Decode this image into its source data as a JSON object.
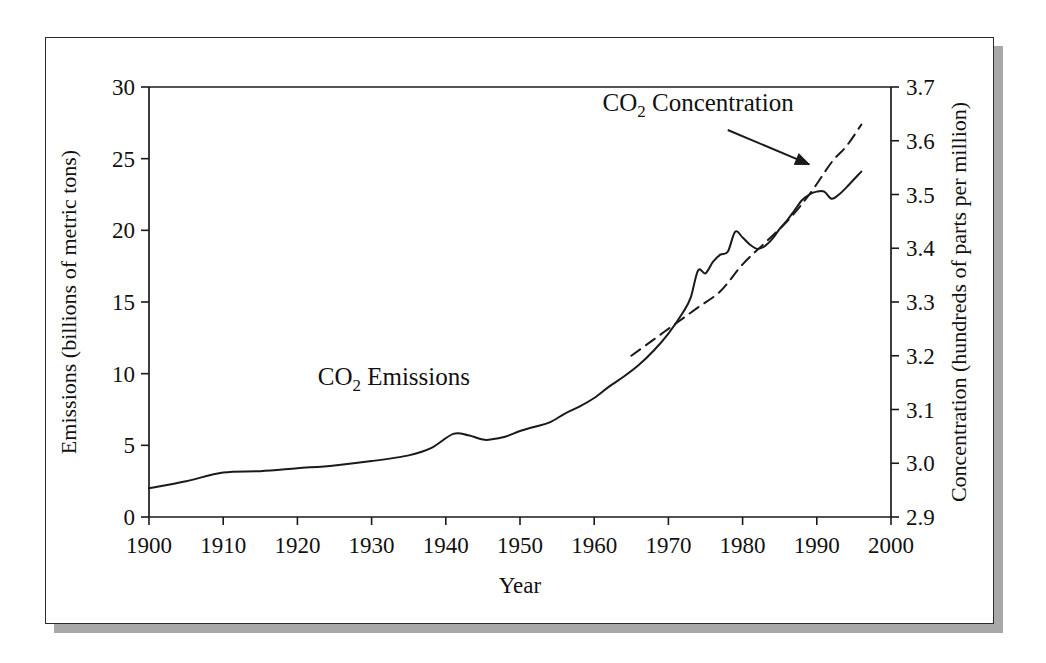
{
  "figure": {
    "background_color": "#ffffff",
    "frame_color": "#2b2b2b",
    "shadow_color": "#a8a8a8",
    "ink_color": "#1a1a1a"
  },
  "chart_data": {
    "type": "line",
    "title": "",
    "xlabel": "Year",
    "ylabel": "Emissions (billions of metric tons)",
    "y2label": "Concentration (hundreds of parts per million)",
    "xlim": [
      1900,
      2000
    ],
    "ylim": [
      0,
      30
    ],
    "y2lim": [
      2.9,
      3.7
    ],
    "grid": false,
    "legend_position": "inline-annotations",
    "xticks": [
      1900,
      1910,
      1920,
      1930,
      1940,
      1950,
      1960,
      1970,
      1980,
      1990,
      2000
    ],
    "xtick_labels": [
      "1900",
      "1910",
      "1920",
      "1930",
      "1940",
      "1950",
      "1960",
      "1970",
      "1980",
      "1990",
      "2000"
    ],
    "yticks": [
      0,
      5,
      10,
      15,
      20,
      25,
      30
    ],
    "ytick_labels": [
      "0",
      "5",
      "10",
      "15",
      "20",
      "25",
      "30"
    ],
    "y2ticks": [
      2.9,
      3.0,
      3.1,
      3.2,
      3.3,
      3.4,
      3.5,
      3.6,
      3.7
    ],
    "y2tick_labels": [
      "2.9",
      "3.0",
      "3.1",
      "3.2",
      "3.3",
      "3.4",
      "3.5",
      "3.6",
      "3.7"
    ],
    "annotations": [
      {
        "name": "co2-emissions-label",
        "text": "CO2 Emissions",
        "text_main": "CO",
        "text_sub": "2",
        "text_rest": " Emissions",
        "x_year": 1933,
        "y_value": 9.2
      },
      {
        "name": "co2-concentration-label",
        "text": "CO2 Concentration",
        "text_main": "CO",
        "text_sub": "2",
        "text_rest": " Concentration",
        "x_year": 1974,
        "y_value": 28.3,
        "arrow_from_year": 1978,
        "arrow_from_value": 27.0,
        "arrow_to_year": 1989,
        "arrow_to_value": 24.6
      }
    ],
    "series": [
      {
        "name": "CO2 Emissions",
        "axis": "left",
        "style": "solid",
        "units": "billions of metric tons",
        "x": [
          1900,
          1905,
          1910,
          1915,
          1920,
          1925,
          1930,
          1935,
          1938,
          1941,
          1943,
          1945,
          1946,
          1948,
          1950,
          1952,
          1954,
          1956,
          1958,
          1960,
          1962,
          1964,
          1966,
          1968,
          1970,
          1972,
          1973,
          1974,
          1975,
          1976,
          1977,
          1978,
          1979,
          1980,
          1981,
          1982,
          1983,
          1984,
          1985,
          1986,
          1987,
          1988,
          1989,
          1990,
          1991,
          1992,
          1993,
          1994,
          1996
        ],
        "values": [
          2.0,
          2.5,
          3.1,
          3.2,
          3.4,
          3.6,
          3.9,
          4.3,
          4.8,
          5.8,
          5.7,
          5.4,
          5.4,
          5.6,
          6.0,
          6.3,
          6.6,
          7.2,
          7.7,
          8.3,
          9.1,
          9.8,
          10.6,
          11.6,
          12.8,
          14.3,
          15.3,
          17.2,
          17.0,
          17.8,
          18.3,
          18.5,
          19.9,
          19.5,
          19.0,
          18.7,
          18.9,
          19.4,
          20.1,
          20.7,
          21.4,
          22.1,
          22.5,
          22.7,
          22.7,
          22.2,
          22.5,
          23.0,
          24.1
        ]
      },
      {
        "name": "CO2 Concentration",
        "axis": "right",
        "style": "dashed",
        "units": "hundreds of parts per million",
        "x": [
          1965,
          1968,
          1971,
          1974,
          1977,
          1980,
          1983,
          1986,
          1989,
          1992,
          1994,
          1996
        ],
        "values": [
          3.2,
          3.23,
          3.26,
          3.29,
          3.32,
          3.37,
          3.41,
          3.45,
          3.5,
          3.56,
          3.59,
          3.63
        ]
      }
    ]
  }
}
